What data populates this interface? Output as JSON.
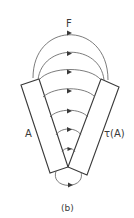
{
  "figure": {
    "field_label": "F",
    "left_region_label": "A",
    "right_region_label": "τ(A)",
    "caption": "(b)",
    "colors": {
      "line": "#3a3a3a",
      "field": "#5a5a5a",
      "background": "#ffffff"
    },
    "field_lines": {
      "outer_arcs": 3,
      "inner_arcs": 4,
      "bottom_loop": 1,
      "arrow_direction": "right"
    }
  }
}
